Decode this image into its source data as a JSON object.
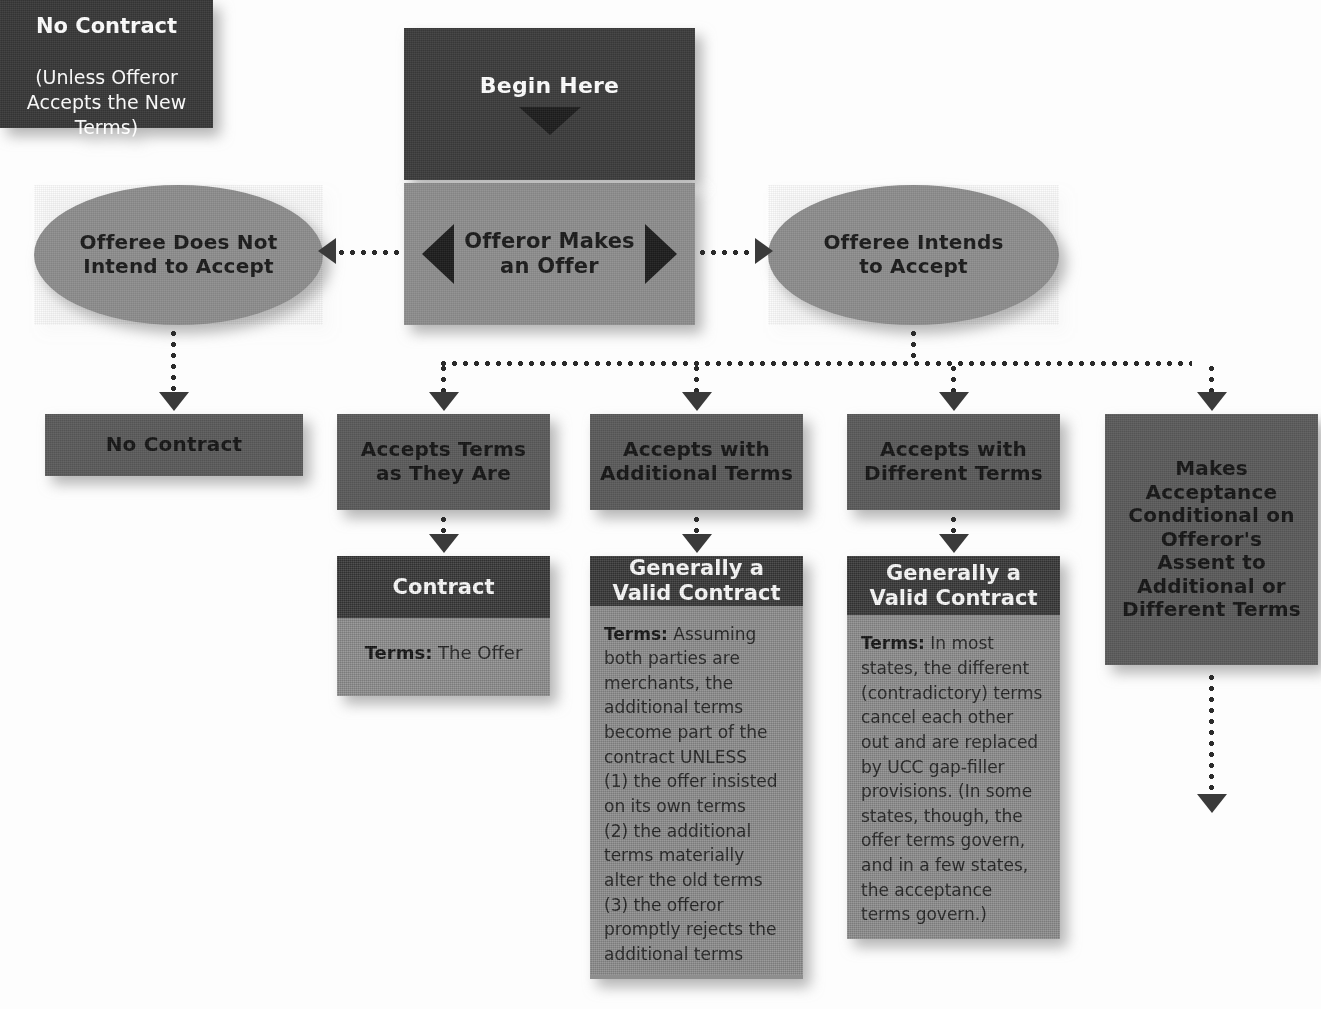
{
  "diagram": {
    "colors": {
      "dark": "#3c3c3c",
      "mid": "#5b5b5b",
      "gray": "#8e8e8e",
      "arrow": "#2b2b2b",
      "text_light": "#ffffff",
      "text_dark": "#1a1a1a"
    },
    "nodes": {
      "begin_here": "Begin Here",
      "offeror_offer": "Offeror Makes\nan Offer",
      "offeree_not_accept": "Offeree Does Not\nIntend to Accept",
      "offeree_intends": "Offeree Intends\nto Accept",
      "no_contract_1": "No Contract",
      "accepts_terms": "Accepts Terms\nas They Are",
      "accepts_additional": "Accepts with\nAdditional Terms",
      "accepts_different": "Accepts with\nDifferent Terms",
      "makes_conditional": "Makes\nAcceptance\nConditional on\nOfferor's\nAssent to\nAdditional or\nDifferent Terms"
    },
    "cards": {
      "contract": {
        "head": "Contract",
        "terms_label": "Terms:",
        "terms_text": " The Offer"
      },
      "additional": {
        "head": "Generally a\nValid Contract",
        "terms_label": "Terms:",
        "terms_text": " Assuming both parties are merchants, the additional terms become part of the contract UNLESS\n(1) the offer insisted on its own terms\n(2) the additional terms materially alter the old terms\n(3) the offeror promptly rejects the additional terms"
      },
      "different": {
        "head": "Generally a\nValid Contract",
        "terms_label": "Terms:",
        "terms_text": " In most states, the different (contradictory) terms cancel each other out and are replaced by UCC gap-filler provisions. (In some states, though, the offer terms govern, and in a few states, the acceptance terms govern.)"
      },
      "no_contract_2": {
        "head": "No Contract",
        "sub": "(Unless Offeror\nAccepts the New\nTerms)"
      }
    },
    "icons": {
      "begin_marker": "triangle-down-icon",
      "branch_left": "triangle-left-icon",
      "branch_right": "triangle-right-icon"
    }
  }
}
